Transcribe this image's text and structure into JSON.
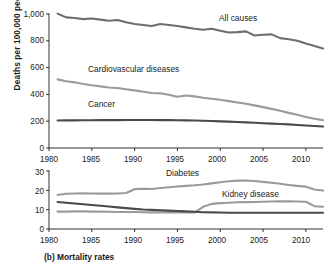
{
  "caption": "(b)  Mortality rates",
  "axis": {
    "ylabel_top": "Deaths per 100,000 people",
    "yticks_top": [
      "1,000",
      "800",
      "600",
      "400",
      "200",
      "0"
    ],
    "yticks_bottom": [
      "30",
      "20",
      "10",
      "0"
    ],
    "xticks": [
      "1980",
      "1985",
      "1990",
      "1995",
      "2000",
      "2005",
      "2010"
    ]
  },
  "colors": {
    "dark_line": "#4a4a4a",
    "mid_line": "#6e6e6e",
    "light_line": "#9a9a9a",
    "axis": "#1a1a1a",
    "text": "#1a1a1a"
  },
  "labels": {
    "all_causes": "All causes",
    "cardiovascular": "Cardiovascular diseases",
    "cancer": "Cancer",
    "diabetes": "Diabetes",
    "kidney": "Kidney disease"
  },
  "chart_data": [
    {
      "type": "line",
      "id": "top-panel",
      "title": "",
      "xlabel": "",
      "ylabel": "Deaths per 100,000 people",
      "xlim": [
        1980,
        2012
      ],
      "ylim": [
        0,
        1000
      ],
      "ytick_values": [
        0,
        200,
        400,
        600,
        800,
        1000
      ],
      "xtick_values": [
        1980,
        1985,
        1990,
        1995,
        2000,
        2005,
        2010
      ],
      "grid": false,
      "legend": "inline-annotations",
      "x": [
        1981,
        1982,
        1983,
        1984,
        1985,
        1986,
        1987,
        1988,
        1989,
        1990,
        1991,
        1992,
        1993,
        1994,
        1995,
        1996,
        1997,
        1998,
        1999,
        2000,
        2001,
        2002,
        2003,
        2004,
        2005,
        2006,
        2007,
        2008,
        2009,
        2010,
        2011,
        2012
      ],
      "series": [
        {
          "name": "All causes",
          "color": "#6e6e6e",
          "values": [
            1003,
            975,
            970,
            962,
            966,
            958,
            950,
            955,
            938,
            925,
            918,
            910,
            925,
            918,
            910,
            900,
            890,
            882,
            890,
            875,
            862,
            865,
            870,
            840,
            845,
            848,
            820,
            812,
            800,
            780,
            762,
            742
          ]
        },
        {
          "name": "Cardiovascular diseases",
          "color": "#9a9a9a",
          "values": [
            512,
            498,
            490,
            478,
            468,
            460,
            452,
            448,
            438,
            430,
            420,
            410,
            408,
            398,
            382,
            392,
            385,
            375,
            368,
            360,
            350,
            340,
            330,
            318,
            305,
            292,
            278,
            262,
            248,
            232,
            218,
            208
          ]
        },
        {
          "name": "Cancer",
          "color": "#4a4a4a",
          "values": [
            205,
            206,
            206,
            207,
            207,
            208,
            208,
            208,
            209,
            209,
            209,
            209,
            208,
            208,
            207,
            206,
            205,
            203,
            201,
            199,
            197,
            194,
            191,
            188,
            185,
            182,
            179,
            176,
            172,
            168,
            164,
            160
          ]
        }
      ]
    },
    {
      "type": "line",
      "id": "bottom-panel",
      "title": "",
      "xlabel": "",
      "ylabel": "",
      "xlim": [
        1980,
        2012
      ],
      "ylim": [
        0,
        30
      ],
      "ytick_values": [
        0,
        10,
        20,
        30
      ],
      "xtick_values": [
        1980,
        1985,
        1990,
        1995,
        2000,
        2005,
        2010
      ],
      "grid": false,
      "legend": "inline-annotations",
      "x": [
        1981,
        1982,
        1983,
        1984,
        1985,
        1986,
        1987,
        1988,
        1989,
        1990,
        1991,
        1992,
        1993,
        1994,
        1995,
        1996,
        1997,
        1998,
        1999,
        2000,
        2001,
        2002,
        2003,
        2004,
        2005,
        2006,
        2007,
        2008,
        2009,
        2010,
        2011,
        2012
      ],
      "series": [
        {
          "name": "Diabetes",
          "color": "#9a9a9a",
          "values": [
            17.6,
            18.2,
            18.4,
            18.5,
            18.4,
            18.3,
            18.3,
            18.4,
            18.6,
            20.6,
            20.8,
            20.7,
            21.2,
            21.6,
            22.0,
            22.3,
            22.6,
            23.0,
            23.6,
            24.2,
            24.7,
            25.0,
            25.1,
            24.8,
            24.4,
            23.9,
            23.4,
            22.8,
            22.3,
            21.9,
            20.4,
            19.9
          ]
        },
        {
          "name": "Kidney disease",
          "color": "#9a9a9a",
          "values": [
            9.0,
            9.0,
            9.1,
            9.1,
            9.0,
            9.0,
            8.9,
            8.8,
            8.8,
            8.8,
            8.7,
            8.6,
            8.6,
            8.6,
            8.5,
            8.5,
            8.5,
            11.5,
            13.0,
            13.4,
            13.6,
            13.8,
            13.9,
            14.0,
            14.1,
            14.2,
            14.3,
            14.3,
            14.2,
            14.1,
            11.8,
            11.5
          ]
        },
        {
          "name": "Unlabeled dark series",
          "color": "#4a4a4a",
          "values": [
            14.0,
            13.6,
            13.2,
            12.8,
            12.4,
            12.0,
            11.6,
            11.2,
            10.8,
            10.4,
            10.1,
            9.9,
            9.7,
            9.5,
            9.3,
            9.1,
            8.9,
            8.7,
            8.6,
            8.5,
            8.4,
            8.4,
            8.4,
            8.4,
            8.4,
            8.4,
            8.4,
            8.4,
            8.4,
            8.4,
            8.4,
            8.4
          ]
        }
      ]
    }
  ]
}
